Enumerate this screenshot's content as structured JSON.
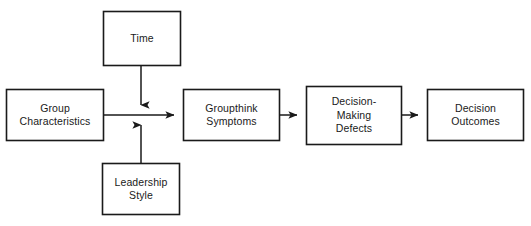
{
  "diagram": {
    "background_color": "#ffffff",
    "line_color": "#1a1a1a",
    "text_color": "#1a1a1a",
    "nodes": [
      {
        "id": "time",
        "label": "Time",
        "x": 103,
        "y": 11,
        "width": 78,
        "height": 55
      },
      {
        "id": "group-characteristics",
        "label": "Group\nCharacteristics",
        "x": 6,
        "y": 89,
        "width": 98,
        "height": 52
      },
      {
        "id": "groupthink-symptoms",
        "label": "Groupthink\nSymptoms",
        "x": 183,
        "y": 89,
        "width": 97,
        "height": 52
      },
      {
        "id": "decision-making-defects",
        "label": "Decision-\nMaking\nDefects",
        "x": 306,
        "y": 86,
        "width": 96,
        "height": 59
      },
      {
        "id": "decision-outcomes",
        "label": "Decision\nOutcomes",
        "x": 427,
        "y": 89,
        "width": 97,
        "height": 52
      },
      {
        "id": "leadership-style",
        "label": "Leadership\nStyle",
        "x": 102,
        "y": 163,
        "width": 78,
        "height": 52
      }
    ],
    "connectors": [
      {
        "id": "group-characteristics-to-groupthink-symptoms",
        "from": "group-characteristics",
        "to": "groupthink-symptoms",
        "arrowhead": "end"
      },
      {
        "id": "time-to-main-flow",
        "from": "time",
        "to": "group-characteristics-to-groupthink-symptoms",
        "arrowhead": "end"
      },
      {
        "id": "leadership-style-to-main-flow",
        "from": "leadership-style",
        "to": "group-characteristics-to-groupthink-symptoms",
        "arrowhead": "end"
      },
      {
        "id": "groupthink-symptoms-to-decision-making-defects",
        "from": "groupthink-symptoms",
        "to": "decision-making-defects",
        "arrowhead": "end"
      },
      {
        "id": "decision-making-defects-to-decision-outcomes",
        "from": "decision-making-defects",
        "to": "decision-outcomes",
        "arrowhead": "end"
      }
    ]
  }
}
